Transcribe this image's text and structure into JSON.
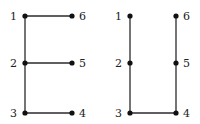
{
  "diagram": {
    "type": "graph-pair",
    "colors": {
      "edge": "#2a2a2a",
      "node": "#111111",
      "label": "#222222"
    },
    "graphs": [
      {
        "name": "left-graph",
        "shape": "E",
        "nodes": [
          {
            "id": "1",
            "label": "1",
            "x": 25,
            "y": 16,
            "label_side": "left"
          },
          {
            "id": "2",
            "label": "2",
            "x": 25,
            "y": 63,
            "label_side": "left"
          },
          {
            "id": "3",
            "label": "3",
            "x": 25,
            "y": 113,
            "label_side": "left"
          },
          {
            "id": "4",
            "label": "4",
            "x": 72,
            "y": 113,
            "label_side": "right"
          },
          {
            "id": "5",
            "label": "5",
            "x": 72,
            "y": 63,
            "label_side": "right"
          },
          {
            "id": "6",
            "label": "6",
            "x": 72,
            "y": 16,
            "label_side": "right"
          }
        ],
        "edges": [
          [
            "1",
            "2"
          ],
          [
            "2",
            "3"
          ],
          [
            "1",
            "6"
          ],
          [
            "2",
            "5"
          ],
          [
            "3",
            "4"
          ]
        ]
      },
      {
        "name": "right-graph",
        "shape": "U",
        "nodes": [
          {
            "id": "1",
            "label": "1",
            "x": 130,
            "y": 16,
            "label_side": "left"
          },
          {
            "id": "2",
            "label": "2",
            "x": 130,
            "y": 63,
            "label_side": "left"
          },
          {
            "id": "3",
            "label": "3",
            "x": 130,
            "y": 113,
            "label_side": "left"
          },
          {
            "id": "4",
            "label": "4",
            "x": 176,
            "y": 113,
            "label_side": "right"
          },
          {
            "id": "5",
            "label": "5",
            "x": 176,
            "y": 63,
            "label_side": "right"
          },
          {
            "id": "6",
            "label": "6",
            "x": 176,
            "y": 16,
            "label_side": "right"
          }
        ],
        "edges": [
          [
            "1",
            "2"
          ],
          [
            "2",
            "3"
          ],
          [
            "3",
            "4"
          ],
          [
            "4",
            "5"
          ],
          [
            "5",
            "6"
          ]
        ]
      }
    ]
  }
}
